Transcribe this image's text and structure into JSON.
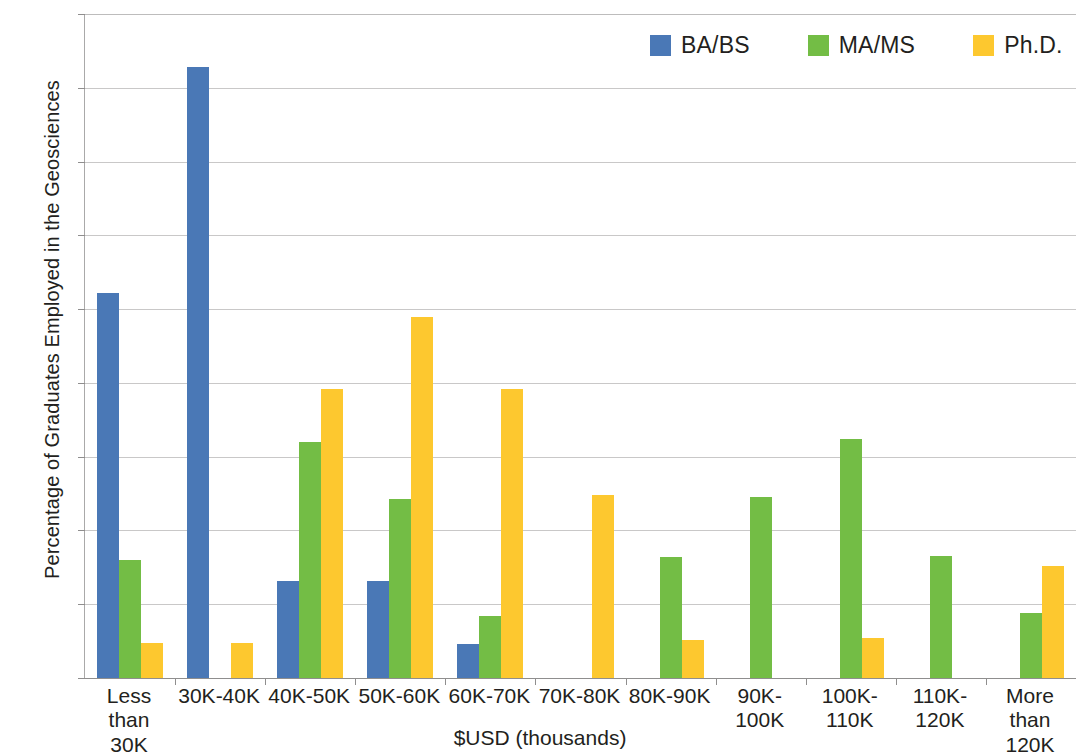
{
  "chart_data": {
    "type": "bar",
    "title": "",
    "xlabel": "$USD (thousands)",
    "ylabel": "Percentage of Graduates Employed in the Geosciences",
    "ylim": [
      0,
      45
    ],
    "ytick_step": 5,
    "ytick_labels": [
      "0%",
      "5%",
      "10%",
      "15%",
      "20%",
      "25%",
      "30%",
      "35%",
      "40%",
      "45%"
    ],
    "ytick_values": [
      0,
      5,
      10,
      15,
      20,
      25,
      30,
      35,
      40,
      45
    ],
    "grid": true,
    "legend_position": "top-right",
    "value_unit": "%",
    "categories": [
      "Less than 30K",
      "30K-40K",
      "40K-50K",
      "50K-60K",
      "60K-70K",
      "70K-80K",
      "80K-90K",
      "90K-100K",
      "100K-110K",
      "110K-120K",
      "More than 120K"
    ],
    "category_label_lines": [
      [
        "Less than",
        "30K"
      ],
      [
        "30K-40K"
      ],
      [
        "40K-50K"
      ],
      [
        "50K-60K"
      ],
      [
        "60K-70K"
      ],
      [
        "70K-80K"
      ],
      [
        "80K-90K"
      ],
      [
        "90K-",
        "100K"
      ],
      [
        "100K-",
        "110K"
      ],
      [
        "110K-",
        "120K"
      ],
      [
        "More than",
        "120K"
      ]
    ],
    "series": [
      {
        "name": "BA/BS",
        "color": "#4A78B6",
        "values": [
          26.1,
          41.4,
          6.6,
          6.6,
          2.3,
          0,
          0,
          0,
          0,
          0,
          0
        ]
      },
      {
        "name": "MA/MS",
        "color": "#73BD45",
        "values": [
          8.0,
          0,
          16.0,
          12.1,
          4.2,
          0,
          8.2,
          12.3,
          16.2,
          8.3,
          4.4
        ]
      },
      {
        "name": "Ph.D.",
        "color": "#FDC82F",
        "values": [
          2.4,
          2.4,
          19.6,
          24.5,
          19.6,
          12.4,
          2.6,
          0,
          2.7,
          0,
          7.6
        ]
      }
    ]
  }
}
